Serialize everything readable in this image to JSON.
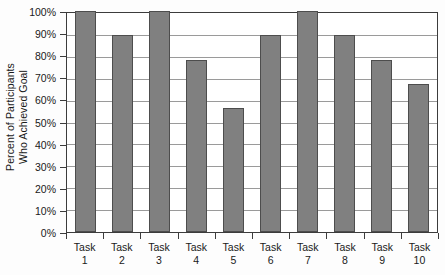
{
  "chart_data": {
    "type": "bar",
    "title": "",
    "xlabel": "",
    "ylabel": "Percent of Participants Who Achieved Goal",
    "categories": [
      "Task 1",
      "Task 2",
      "Task 3",
      "Task 4",
      "Task 5",
      "Task 6",
      "Task 7",
      "Task 8",
      "Task 9",
      "Task 10"
    ],
    "values": [
      100,
      89,
      100,
      78,
      56,
      89,
      100,
      89,
      78,
      67
    ],
    "ylim": [
      0,
      100
    ],
    "ytick_values": [
      0,
      10,
      20,
      30,
      40,
      50,
      60,
      70,
      80,
      90,
      100
    ],
    "ytick_labels": [
      "0%",
      "10%",
      "20%",
      "30%",
      "40%",
      "50%",
      "60%",
      "70%",
      "80%",
      "90%",
      "100%"
    ],
    "grid": true,
    "legend": false,
    "legend_position": "none",
    "bar_color": "#808080",
    "bar_edge_color": "#4d4d4d",
    "gridline_color": "#9a9a9a",
    "axis_color": "#3c3c3c",
    "background_color": "#ffffff"
  },
  "axes": {
    "y_title_line1": "Percent of Participants",
    "y_title_line2": "Who Achieved Goal"
  },
  "x_labels": [
    {
      "line1": "Task",
      "line2": "1"
    },
    {
      "line1": "Task",
      "line2": "2"
    },
    {
      "line1": "Task",
      "line2": "3"
    },
    {
      "line1": "Task",
      "line2": "4"
    },
    {
      "line1": "Task",
      "line2": "5"
    },
    {
      "line1": "Task",
      "line2": "6"
    },
    {
      "line1": "Task",
      "line2": "7"
    },
    {
      "line1": "Task",
      "line2": "8"
    },
    {
      "line1": "Task",
      "line2": "9"
    },
    {
      "line1": "Task",
      "line2": "10"
    }
  ]
}
